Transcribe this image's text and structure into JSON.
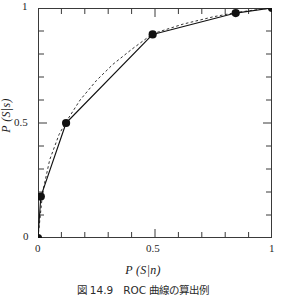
{
  "figure": {
    "caption": "図 14.9　ROC 曲線の算出例"
  },
  "axes": {
    "x_title_p": "P",
    "x_title_arg": "(S|n)",
    "y_title_p": "P",
    "y_title_arg": "(S|s)",
    "x_ticks": [
      "0",
      "0.5",
      "1"
    ],
    "y_ticks": [
      "0",
      "0.5",
      "1"
    ]
  },
  "chart_data": {
    "type": "line",
    "title": "図 14.9　ROC 曲線の算出例",
    "xlabel": "P (S|n)",
    "ylabel": "P (S|s)",
    "xlim": [
      0,
      1
    ],
    "ylim": [
      0,
      1
    ],
    "xticks": [
      0,
      0.5,
      1
    ],
    "yticks": [
      0,
      0.5,
      1
    ],
    "minor_tick_count": 10,
    "grid": false,
    "legend": null,
    "frame": "box",
    "tick_direction": "in",
    "series": [
      {
        "name": "empirical ROC (markers + solid line)",
        "style": "solid",
        "marker": "filled-circle",
        "color": "#111111",
        "x": [
          0,
          0.012,
          0.12,
          0.49,
          0.845,
          1
        ],
        "y": [
          0,
          0.18,
          0.5,
          0.885,
          0.978,
          1
        ]
      },
      {
        "name": "fitted ROC (dashed curve)",
        "style": "dashed",
        "marker": "none",
        "color": "#333333",
        "x": [
          0,
          0.02,
          0.05,
          0.09,
          0.12,
          0.18,
          0.25,
          0.32,
          0.4,
          0.49,
          0.62,
          0.75,
          0.845,
          0.93,
          1
        ],
        "y": [
          0,
          0.2,
          0.34,
          0.45,
          0.505,
          0.6,
          0.685,
          0.755,
          0.82,
          0.888,
          0.93,
          0.962,
          0.98,
          0.992,
          1
        ]
      }
    ]
  }
}
